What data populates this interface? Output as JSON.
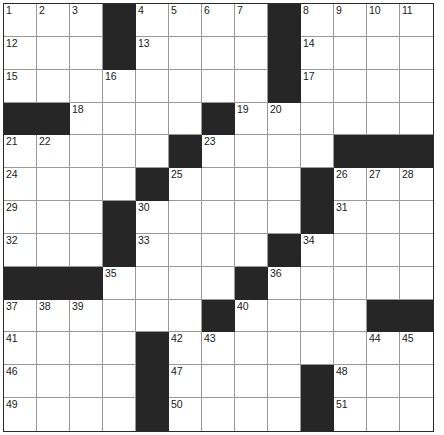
{
  "puzzle": {
    "type": "crossword-grid",
    "columns": 13,
    "rows": 13,
    "colors": {
      "block": "#262626",
      "cell": "#ffffff",
      "grid_line": "#9a9a9a",
      "outer_border": "#2b2b2b",
      "number_text": "#1a1a1a"
    },
    "numbered_cells": [
      {
        "number": "1",
        "row": 1,
        "col": 1
      },
      {
        "number": "2",
        "row": 1,
        "col": 2
      },
      {
        "number": "3",
        "row": 1,
        "col": 3
      },
      {
        "number": "4",
        "row": 1,
        "col": 5
      },
      {
        "number": "5",
        "row": 1,
        "col": 6
      },
      {
        "number": "6",
        "row": 1,
        "col": 7
      },
      {
        "number": "7",
        "row": 1,
        "col": 8
      },
      {
        "number": "8",
        "row": 1,
        "col": 10
      },
      {
        "number": "9",
        "row": 1,
        "col": 11
      },
      {
        "number": "10",
        "row": 1,
        "col": 12
      },
      {
        "number": "11",
        "row": 1,
        "col": 13
      },
      {
        "number": "12",
        "row": 2,
        "col": 1
      },
      {
        "number": "13",
        "row": 2,
        "col": 5
      },
      {
        "number": "14",
        "row": 2,
        "col": 10
      },
      {
        "number": "15",
        "row": 3,
        "col": 1
      },
      {
        "number": "16",
        "row": 3,
        "col": 4
      },
      {
        "number": "17",
        "row": 3,
        "col": 10
      },
      {
        "number": "18",
        "row": 4,
        "col": 3
      },
      {
        "number": "19",
        "row": 4,
        "col": 8
      },
      {
        "number": "20",
        "row": 4,
        "col": 9
      },
      {
        "number": "21",
        "row": 5,
        "col": 1
      },
      {
        "number": "22",
        "row": 5,
        "col": 2
      },
      {
        "number": "23",
        "row": 5,
        "col": 7
      },
      {
        "number": "24",
        "row": 6,
        "col": 1
      },
      {
        "number": "25",
        "row": 6,
        "col": 6
      },
      {
        "number": "26",
        "row": 6,
        "col": 11
      },
      {
        "number": "27",
        "row": 6,
        "col": 12
      },
      {
        "number": "28",
        "row": 6,
        "col": 13
      },
      {
        "number": "29",
        "row": 7,
        "col": 1
      },
      {
        "number": "30",
        "row": 7,
        "col": 5
      },
      {
        "number": "31",
        "row": 7,
        "col": 11
      },
      {
        "number": "32",
        "row": 8,
        "col": 1
      },
      {
        "number": "33",
        "row": 8,
        "col": 5
      },
      {
        "number": "34",
        "row": 8,
        "col": 10
      },
      {
        "number": "35",
        "row": 9,
        "col": 4
      },
      {
        "number": "36",
        "row": 9,
        "col": 9
      },
      {
        "number": "37",
        "row": 10,
        "col": 1
      },
      {
        "number": "38",
        "row": 10,
        "col": 2
      },
      {
        "number": "39",
        "row": 10,
        "col": 3
      },
      {
        "number": "40",
        "row": 10,
        "col": 8
      },
      {
        "number": "41",
        "row": 11,
        "col": 1
      },
      {
        "number": "42",
        "row": 11,
        "col": 6
      },
      {
        "number": "43",
        "row": 11,
        "col": 7
      },
      {
        "number": "44",
        "row": 11,
        "col": 12
      },
      {
        "number": "45",
        "row": 11,
        "col": 13
      },
      {
        "number": "46",
        "row": 12,
        "col": 1
      },
      {
        "number": "47",
        "row": 12,
        "col": 6
      },
      {
        "number": "48",
        "row": 12,
        "col": 11
      },
      {
        "number": "49",
        "row": 13,
        "col": 1
      },
      {
        "number": "50",
        "row": 13,
        "col": 6
      },
      {
        "number": "51",
        "row": 13,
        "col": 11
      }
    ],
    "block_cells": [
      {
        "row": 1,
        "col": 4
      },
      {
        "row": 1,
        "col": 9
      },
      {
        "row": 2,
        "col": 4
      },
      {
        "row": 2,
        "col": 9
      },
      {
        "row": 3,
        "col": 9
      },
      {
        "row": 4,
        "col": 1
      },
      {
        "row": 4,
        "col": 2
      },
      {
        "row": 4,
        "col": 7
      },
      {
        "row": 5,
        "col": 6
      },
      {
        "row": 5,
        "col": 11
      },
      {
        "row": 5,
        "col": 12
      },
      {
        "row": 5,
        "col": 13
      },
      {
        "row": 6,
        "col": 5
      },
      {
        "row": 6,
        "col": 10
      },
      {
        "row": 7,
        "col": 4
      },
      {
        "row": 7,
        "col": 10
      },
      {
        "row": 8,
        "col": 4
      },
      {
        "row": 8,
        "col": 9
      },
      {
        "row": 9,
        "col": 1
      },
      {
        "row": 9,
        "col": 2
      },
      {
        "row": 9,
        "col": 3
      },
      {
        "row": 9,
        "col": 8
      },
      {
        "row": 10,
        "col": 7
      },
      {
        "row": 10,
        "col": 12
      },
      {
        "row": 10,
        "col": 13
      },
      {
        "row": 11,
        "col": 5
      },
      {
        "row": 12,
        "col": 5
      },
      {
        "row": 12,
        "col": 10
      },
      {
        "row": 13,
        "col": 5
      },
      {
        "row": 13,
        "col": 10
      }
    ],
    "entries": []
  }
}
